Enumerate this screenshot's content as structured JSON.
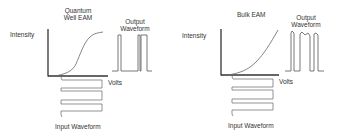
{
  "panels": [
    {
      "title": "Quantum Well EAM",
      "title_line1": "Quantum",
      "title_line2": "Well EAM",
      "y_label": "Intensity",
      "x_label": "Volts",
      "output_label_line1": "Output",
      "output_label_line2": "Waveform",
      "input_label": "Input Waveform",
      "curve_shape": "sigmoid"
    },
    {
      "title": "Bulk EAM",
      "y_label": "Intensity",
      "x_label": "Volts",
      "output_label_line1": "Output",
      "output_label_line2": "Waveform",
      "input_label": "Input Waveform",
      "curve_shape": "gradual-rise"
    }
  ],
  "colors": {
    "axis": "#333333",
    "curve": "#555555",
    "waveform": "#555555",
    "text": "#333333"
  }
}
